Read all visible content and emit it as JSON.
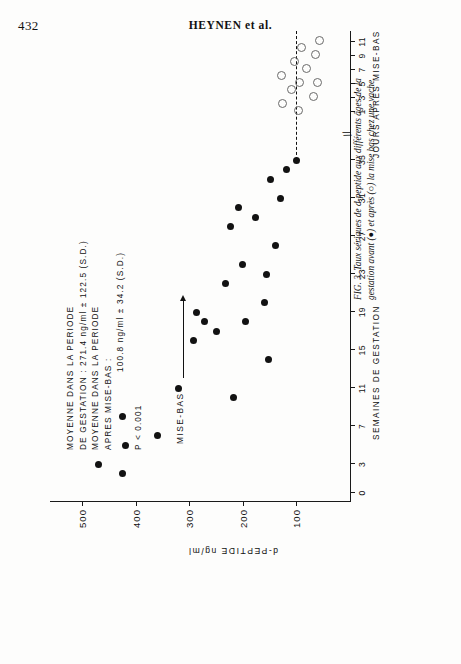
{
  "page": {
    "folio": "432",
    "running_head": "HEYNEN et al."
  },
  "figure": {
    "annotation": {
      "line1": "MOYENNE DANS LA PERIODE",
      "line2": "DE GESTATION : 271.4 ng/ml ± 122.5 (S.D.)",
      "line3": "MOYENNE DANS LA PERIODE",
      "line4": "APRES MISE-BAS :",
      "line5": "100.8 ng/ml ± 34.2 (S.D.)",
      "pvalue": "P < 0.001"
    },
    "parturition_label": "MISE-BAS",
    "axis_break_symbol": "//",
    "caption_number": "FIG. 3.",
    "caption_text": "Taux sériques de d-peptide aux différents âges de la gestation avant (●) et après (○) la mise bas chez une vache."
  },
  "chart_data": {
    "type": "scatter",
    "title": "",
    "xlabel": "SEMAINES DE GESTATION",
    "xlabel2": "JOURS APRES MISE-BAS",
    "ylabel": "d-PEPTIDE ng/ml",
    "ylim": [
      0,
      560
    ],
    "yticks": [
      100,
      200,
      300,
      400,
      500
    ],
    "ytick_labels": [
      "100",
      "200",
      "300",
      "400",
      "500"
    ],
    "xticks_weeks": [
      0,
      3,
      7,
      11,
      15,
      19,
      23,
      27,
      31,
      35
    ],
    "xtick_labels_weeks": [
      "0",
      "3",
      "7",
      "11",
      "15",
      "19",
      "23",
      "27",
      "31",
      "35"
    ],
    "xticks_days": [
      1,
      3,
      5,
      7,
      9,
      11
    ],
    "xtick_labels_days": [
      "1",
      "3",
      "5",
      "7",
      "9",
      "11"
    ],
    "grid": false,
    "legend": [
      "avant la mise bas (●)",
      "après la mise bas (○)"
    ],
    "series": [
      {
        "name": "avant la mise bas",
        "marker": "filled-circle",
        "axis": "weeks",
        "points": [
          {
            "x": 2,
            "y": 424
          },
          {
            "x": 3,
            "y": 470
          },
          {
            "x": 5,
            "y": 420
          },
          {
            "x": 6,
            "y": 360
          },
          {
            "x": 8,
            "y": 425
          },
          {
            "x": 10,
            "y": 218
          },
          {
            "x": 11,
            "y": 320
          },
          {
            "x": 14,
            "y": 152
          },
          {
            "x": 16,
            "y": 292
          },
          {
            "x": 17,
            "y": 250
          },
          {
            "x": 18,
            "y": 272
          },
          {
            "x": 18,
            "y": 196
          },
          {
            "x": 19,
            "y": 286
          },
          {
            "x": 20,
            "y": 160
          },
          {
            "x": 22,
            "y": 232
          },
          {
            "x": 23,
            "y": 155
          },
          {
            "x": 24,
            "y": 200
          },
          {
            "x": 26,
            "y": 140
          },
          {
            "x": 28,
            "y": 223
          },
          {
            "x": 29,
            "y": 176
          },
          {
            "x": 30,
            "y": 208
          },
          {
            "x": 31,
            "y": 130
          },
          {
            "x": 33,
            "y": 148
          },
          {
            "x": 34,
            "y": 118
          },
          {
            "x": 35,
            "y": 100
          }
        ]
      },
      {
        "name": "apres la mise bas",
        "marker": "open-circle",
        "axis": "days",
        "points": [
          {
            "x": 1,
            "y": 98
          },
          {
            "x": 2,
            "y": 128
          },
          {
            "x": 3,
            "y": 70
          },
          {
            "x": 4,
            "y": 112
          },
          {
            "x": 5,
            "y": 96
          },
          {
            "x": 5,
            "y": 62
          },
          {
            "x": 6,
            "y": 130
          },
          {
            "x": 7,
            "y": 84
          },
          {
            "x": 8,
            "y": 106
          },
          {
            "x": 9,
            "y": 66
          },
          {
            "x": 10,
            "y": 92
          },
          {
            "x": 11,
            "y": 58
          }
        ]
      }
    ]
  }
}
